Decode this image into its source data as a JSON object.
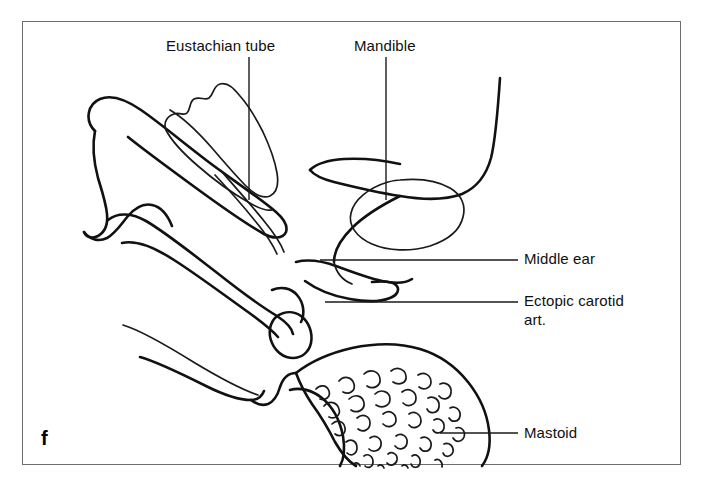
{
  "figure": {
    "panel_letter": "f",
    "frame_color": "#6e6e72",
    "background_color": "#ffffff",
    "stroke_color": "#111111",
    "caption_text_color": "#101010"
  },
  "labels": {
    "eustachian_tube": "Eustachian tube",
    "mandible": "Mandible",
    "middle_ear": "Middle ear",
    "ectopic_carotid_line1": "Ectopic carotid",
    "ectopic_carotid_line2": "art.",
    "mastoid": "Mastoid"
  },
  "structures": [
    {
      "name": "eustachian-tube",
      "label": "Eustachian tube",
      "leader": "vertical",
      "leader_from": [
        249,
        57
      ],
      "leader_to": [
        249,
        200
      ]
    },
    {
      "name": "mandible",
      "label": "Mandible",
      "leader": "vertical",
      "leader_from": [
        386,
        57
      ],
      "leader_to": [
        386,
        200
      ]
    },
    {
      "name": "middle-ear",
      "label": "Middle ear",
      "leader": "horizontal",
      "leader_from": [
        320,
        260
      ],
      "leader_to": [
        518,
        260
      ]
    },
    {
      "name": "ectopic-carotid-art",
      "label": "Ectopic carotid art.",
      "leader": "horizontal",
      "leader_from": [
        325,
        302
      ],
      "leader_to": [
        518,
        302
      ]
    },
    {
      "name": "mastoid",
      "label": "Mastoid",
      "leader": "horizontal",
      "leader_from": [
        440,
        433
      ],
      "leader_to": [
        518,
        433
      ]
    }
  ]
}
